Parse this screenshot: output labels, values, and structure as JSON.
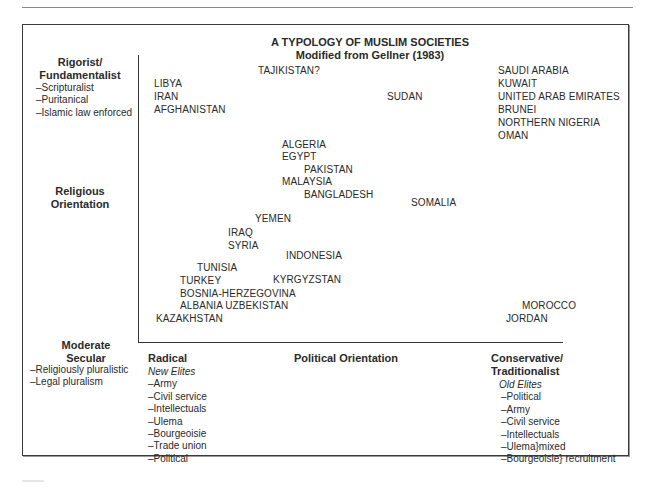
{
  "title": {
    "line1": "A TYPOLOGY OF  MUSLIM SOCIETIES",
    "line2": "Modified from Gellner (1983)"
  },
  "y_axis": {
    "top_label": [
      "Rigorist/",
      "Fundamentalist"
    ],
    "top_items": [
      "–Scripturalist",
      "–Puritanical",
      "–Islamic law enforced"
    ],
    "middle_label": [
      "Religious",
      "Orientation"
    ],
    "bottom_label": [
      "Moderate",
      "Secular"
    ],
    "bottom_items": [
      "–Religiously pluralistic",
      "–Legal pluralism"
    ]
  },
  "x_axis": {
    "center_label": "Political Orientation",
    "left": {
      "label": "Radical",
      "subtitle": "New Elites",
      "items": [
        "–Army",
        "–Civil service",
        "–Intellectuals",
        "–Ulema",
        "–Bourgeoisie",
        "–Trade union",
        "–Political"
      ]
    },
    "right": {
      "label": [
        "Conservative/",
        "Traditionalist"
      ],
      "subtitle": "Old Elites",
      "items": [
        "–Political",
        "–Army",
        "–Civil service",
        "–Intellectuals",
        "–Ulema}mixed",
        "–Bourgeoisie} recruitment"
      ]
    }
  },
  "countries": [
    {
      "name": "TAJIKISTAN?",
      "x": 258,
      "y": 73
    },
    {
      "name": "LIBYA",
      "x": 154,
      "y": 86
    },
    {
      "name": "IRAN",
      "x": 154,
      "y": 99
    },
    {
      "name": "SUDAN",
      "x": 387,
      "y": 99
    },
    {
      "name": "AFGHANISTAN",
      "x": 154,
      "y": 112
    },
    {
      "name": "SAUDI ARABIA",
      "x": 498,
      "y": 73
    },
    {
      "name": "KUWAIT",
      "x": 498,
      "y": 86
    },
    {
      "name": "UNITED ARAB EMIRATES",
      "x": 498,
      "y": 99
    },
    {
      "name": "BRUNEI",
      "x": 498,
      "y": 112
    },
    {
      "name": "NORTHERN NIGERIA",
      "x": 498,
      "y": 125
    },
    {
      "name": "OMAN",
      "x": 498,
      "y": 138
    },
    {
      "name": "ALGERIA",
      "x": 282,
      "y": 147
    },
    {
      "name": "EGYPT",
      "x": 282,
      "y": 159
    },
    {
      "name": "PAKISTAN",
      "x": 304,
      "y": 172
    },
    {
      "name": "MALAYSIA",
      "x": 282,
      "y": 184
    },
    {
      "name": "BANGLADESH",
      "x": 304,
      "y": 197
    },
    {
      "name": "SOMALIA",
      "x": 411,
      "y": 205
    },
    {
      "name": "YEMEN",
      "x": 255,
      "y": 221
    },
    {
      "name": "IRAQ",
      "x": 228,
      "y": 235
    },
    {
      "name": "SYRIA",
      "x": 228,
      "y": 248
    },
    {
      "name": "INDONESIA",
      "x": 286,
      "y": 258
    },
    {
      "name": "TUNISIA",
      "x": 197,
      "y": 270
    },
    {
      "name": "TURKEY",
      "x": 180,
      "y": 283
    },
    {
      "name": "KYRGYZSTAN",
      "x": 273,
      "y": 282
    },
    {
      "name": "BOSNIA-HERZEGOVINA",
      "x": 180,
      "y": 296
    },
    {
      "name": "ALBANIA UZBEKISTAN",
      "x": 180,
      "y": 308
    },
    {
      "name": "MOROCCO",
      "x": 522,
      "y": 308
    },
    {
      "name": "KAZAKHSTAN",
      "x": 156,
      "y": 321
    },
    {
      "name": "JORDAN",
      "x": 506,
      "y": 321
    }
  ]
}
